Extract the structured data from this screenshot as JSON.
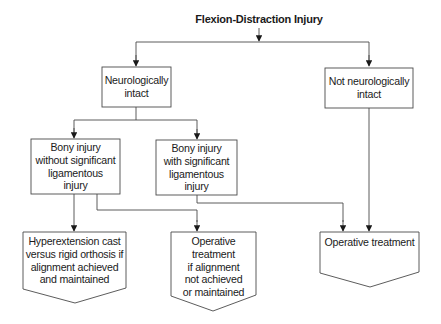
{
  "diagram": {
    "title": "Flexion-Distraction Injury",
    "colors": {
      "line": "#4a4a4a",
      "box_fill": "#ffffff",
      "text": "#1a1a1a",
      "background": "#ffffff"
    },
    "nodes": {
      "neuro_intact": {
        "lines": [
          "Neurologically",
          "intact"
        ]
      },
      "not_neuro_intact": {
        "lines": [
          "Not neurologically",
          "intact"
        ]
      },
      "bony_without": {
        "lines": [
          "Bony injury",
          "without significant",
          "ligamentous",
          "injury"
        ]
      },
      "bony_with": {
        "lines": [
          "Bony injury",
          "with significant",
          "ligamentous",
          "injury"
        ]
      },
      "hyperextension": {
        "lines": [
          "Hyperextension cast",
          "versus rigid orthosis if",
          "alignment achieved",
          "and maintained"
        ]
      },
      "operative_if": {
        "lines": [
          "Operative",
          "treatment",
          "if alignment",
          "not achieved",
          "or maintained"
        ]
      },
      "operative": {
        "lines": [
          "Operative treatment"
        ]
      }
    },
    "edges": [
      {
        "from": "title",
        "to": "neuro_intact"
      },
      {
        "from": "title",
        "to": "not_neuro_intact"
      },
      {
        "from": "neuro_intact",
        "to": "bony_without"
      },
      {
        "from": "neuro_intact",
        "to": "bony_with"
      },
      {
        "from": "bony_without",
        "to": "hyperextension"
      },
      {
        "from": "bony_without",
        "to": "operative_if"
      },
      {
        "from": "bony_with",
        "to": "operative"
      },
      {
        "from": "not_neuro_intact",
        "to": "operative"
      }
    ]
  }
}
